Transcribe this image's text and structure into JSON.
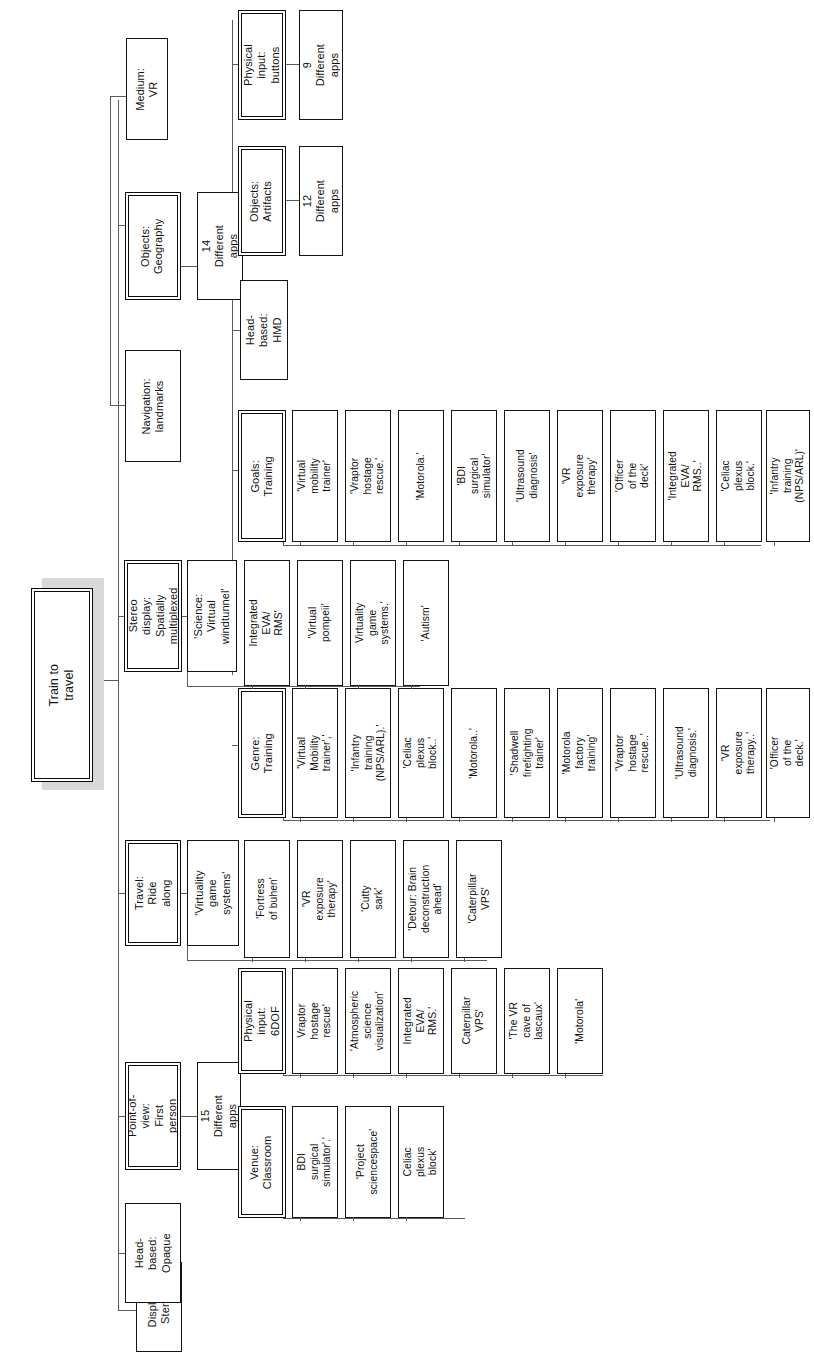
{
  "diagram": {
    "title": "Train to travel",
    "type": "tree-diagram",
    "orientation": "rotated-90-ccw",
    "root": {
      "label": "Train to travel"
    },
    "branches": [
      {
        "label": "Display: Stereo",
        "emphasis": false
      },
      {
        "label": "Head-based:\nOpaque",
        "emphasis": false
      },
      {
        "label": "Point-of-view:\nFirst person",
        "emphasis": true,
        "child": {
          "label": "15 Different apps"
        }
      },
      {
        "label": "Travel: Ride\nalong",
        "emphasis": true,
        "child": {
          "label": "'Virtuality game\nsystems'"
        }
      },
      {
        "label": "Stereo display:\nSpatially\nmultiplexed",
        "emphasis": true,
        "child": {
          "label": "'Science: Virtual\nwindtunnel'"
        }
      },
      {
        "label": "Navigation:\nlandmarks",
        "emphasis": false
      },
      {
        "label": "Objects:\nGeography",
        "emphasis": true,
        "child": {
          "label": "14 Different apps"
        }
      },
      {
        "label": "Medium: VR",
        "emphasis": false
      }
    ],
    "groups": [
      {
        "header": "Venue:\nClassroom",
        "emphasis": true,
        "items": [
          "BDI surgical\nsimulator'.'",
          "'Project\nsciencespace'",
          "Celiac plexus\nblock'"
        ]
      },
      {
        "header": "Physical input:\n6DOF",
        "emphasis": true,
        "items": [
          "Vraptor hostage\nrescue'",
          "'Atmospheric\nscience\nvisualization'",
          "Integrated EVA/\nRMS.'",
          "Caterpillar VPS'",
          "'The VR cave of\nlascaux'",
          "'Motorola'"
        ]
      },
      {
        "header": "Travel: Ride\nalong",
        "emphasis": true,
        "header_child": "'Virtuality game\nsystems'",
        "items": [
          "'Fortress\nof buhen'",
          "'VR exposure\ntherapy'",
          "'Cutty sark'",
          "'Detour: Brain\ndeconstruction\nahead'",
          "'Caterpillar VPS'"
        ]
      },
      {
        "header": "Genre: Training",
        "emphasis": true,
        "items": [
          "'Virtual Mobility\ntrainer','",
          "'Infantry training\n(NPS/ARL).'",
          "'Celiac plexus\nblock..'",
          "'Motorola..'",
          "'Shadwell\nfirefighting\ntrainer'",
          "'Motorola factory\ntraining'",
          "'Vraptor hostage\nrescue..'",
          "'Ultrasound\ndiagnosis.'",
          "'VR exposure\ntherapy..'",
          "'Officer of the\ndeck.'"
        ]
      },
      {
        "header": "Goals: Training",
        "emphasis": true,
        "items": [
          "'Virtual mobility\ntrainer'",
          "'Vraptor hostage\nrescue.'",
          "'Motorola.'",
          "'BDI surgical\nsimulator'",
          "'Ultrasound\ndiagnosis'",
          "'VR exposure\ntherapy'",
          "'Officer of the\ndeck'",
          "'Integrated EVA/\nRMS..'",
          "'Celiac plexus\nblock.'",
          "'Infantry training\n(NPS/ARL)'"
        ]
      },
      {
        "header": "'Science: Virtual\nwindtunnel'",
        "emphasis": false,
        "items": [
          "Integrated EVA/\nRMS'",
          "'Virtual pompeii'",
          "Virtuality game\nsystems.'",
          "'Autism'"
        ]
      },
      {
        "header": "Head-based:\nHMD",
        "emphasis": false,
        "items": []
      },
      {
        "header": "Objects: Artifacts",
        "emphasis": true,
        "items": [
          "12 Different\napps"
        ]
      },
      {
        "header": "Physical input:\nbuttons",
        "emphasis": true,
        "items": [
          "9 Different apps"
        ]
      }
    ]
  },
  "colors": {
    "box_border": "#141414",
    "emphasis_border": "#0a0a0a",
    "connector": "#5a5a5a",
    "shadow": "#d9d9d9",
    "background": "#ffffff",
    "text": "#111111"
  }
}
